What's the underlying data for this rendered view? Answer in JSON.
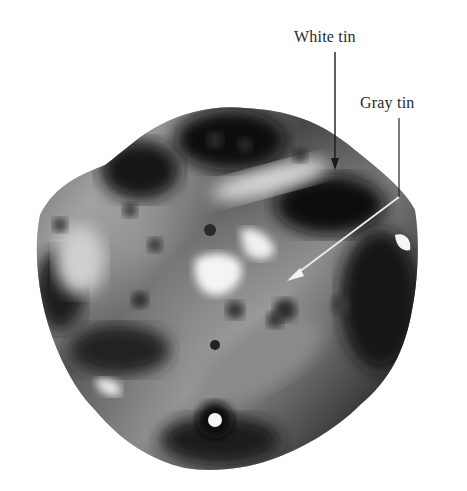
{
  "figure": {
    "labels": [
      {
        "text": "White tin",
        "arrow_color": "#1a1a1a"
      },
      {
        "text": "Gray tin",
        "arrow_color": "#e8e8e8"
      }
    ]
  }
}
